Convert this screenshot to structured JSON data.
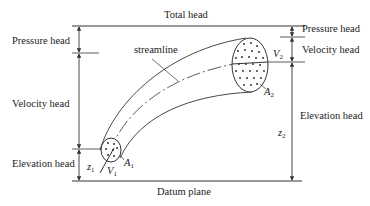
{
  "diagram": {
    "type": "energy-head-streamtube",
    "labels": {
      "total_head": "Total head",
      "datum_plane": "Datum plane",
      "streamline": "streamline",
      "left": {
        "pressure_head": "Pressure head",
        "velocity_head": "Velocity head",
        "elevation_head": "Elevation head"
      },
      "right": {
        "pressure_head": "Pressure head",
        "velocity_head": "Velocity head",
        "elevation_head": "Elevation head"
      }
    },
    "variables": {
      "z1": {
        "base": "z",
        "sub": "1"
      },
      "v1": {
        "base": "V",
        "sub": "1"
      },
      "a1": {
        "base": "A",
        "sub": "1"
      },
      "z2": {
        "base": "z",
        "sub": "2"
      },
      "v2": {
        "base": "V",
        "sub": "2"
      },
      "a2": {
        "base": "A",
        "sub": "2"
      }
    },
    "colors": {
      "line": "#333333",
      "background": "#ffffff"
    }
  }
}
